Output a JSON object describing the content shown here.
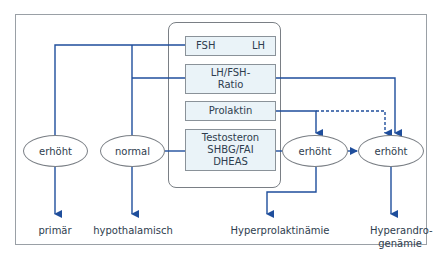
{
  "diagram": {
    "colors": {
      "line": "#1f4e9c",
      "box_fill": "#eaf3f8",
      "box_border": "#8a9299",
      "frame_border": "#9aa0a6",
      "text": "#2e3d4e"
    },
    "lab_boxes": {
      "fsh": "FSH",
      "lh": "LH",
      "ratio_line1": "LH/FSH-",
      "ratio_line2": "Ratio",
      "prolaktin": "Prolaktin",
      "test_line1": "Testosteron",
      "test_line2": "SHBG/FAI",
      "test_line3": "DHEAS"
    },
    "ellipses": {
      "e1": "erhöht",
      "e2": "normal",
      "e3": "erhöht",
      "e4": "erhöht"
    },
    "outcomes": {
      "primaer": "primär",
      "hypothalamisch": "hypothalamisch",
      "hyperprolaktinaemie": "Hyperprolaktinämie",
      "hyperandro_line1": "Hyperandro-",
      "hyperandro_line2": "genämie"
    }
  }
}
